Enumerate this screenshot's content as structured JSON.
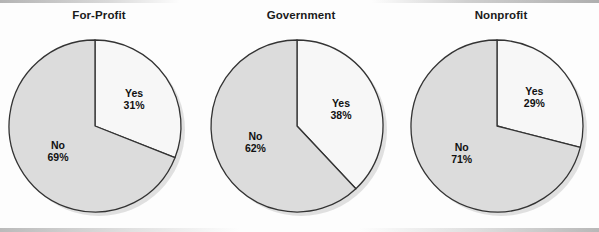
{
  "figure": {
    "type": "pie-chart-panel",
    "panel_count": 3,
    "background_color": "#fdfdfd"
  },
  "style": {
    "yes_color": "#f7f7f7",
    "no_color": "#dcdcdc",
    "outline_color": "#333333",
    "shadow_color": "#c8c8c8",
    "label_color": "#111111"
  },
  "charts": [
    {
      "title": "For-Profit",
      "center_x": 95,
      "radius": 86,
      "yes_label": "Yes",
      "yes_pct": "31%",
      "no_label": "No",
      "no_pct": "69%"
    },
    {
      "title": "Government",
      "center_x": 297,
      "radius": 86,
      "yes_label": "Yes",
      "yes_pct": "38%",
      "no_label": "No",
      "no_pct": "62%"
    },
    {
      "title": "Nonprofit",
      "center_x": 497,
      "radius": 86,
      "yes_label": "Yes",
      "yes_pct": "29%",
      "no_label": "No",
      "no_pct": "71%"
    }
  ],
  "chart_data": [
    {
      "type": "pie",
      "title": "For-Profit",
      "categories": [
        "Yes",
        "No"
      ],
      "values": [
        31,
        69
      ],
      "units": "percent",
      "start_angle_deg": 0,
      "direction": "clockwise",
      "labels_inside": true,
      "legend": "none",
      "colors": [
        "#f7f7f7",
        "#dcdcdc"
      ]
    },
    {
      "type": "pie",
      "title": "Government",
      "categories": [
        "Yes",
        "No"
      ],
      "values": [
        38,
        62
      ],
      "units": "percent",
      "start_angle_deg": 0,
      "direction": "clockwise",
      "labels_inside": true,
      "legend": "none",
      "colors": [
        "#f7f7f7",
        "#dcdcdc"
      ]
    },
    {
      "type": "pie",
      "title": "Nonprofit",
      "categories": [
        "Yes",
        "No"
      ],
      "values": [
        29,
        71
      ],
      "units": "percent",
      "start_angle_deg": 0,
      "direction": "clockwise",
      "labels_inside": true,
      "legend": "none",
      "colors": [
        "#f7f7f7",
        "#dcdcdc"
      ]
    }
  ]
}
